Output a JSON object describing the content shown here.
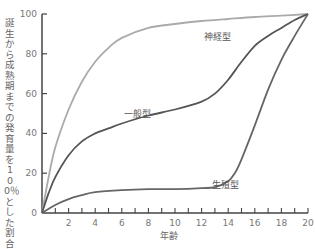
{
  "chart_data": {
    "type": "line",
    "title": "",
    "xlabel": "年齢",
    "ylabel": "誕生から成熟期までの発育量を100％とした割合",
    "xlim": [
      0,
      20
    ],
    "ylim": [
      0,
      100
    ],
    "xticks": [
      2,
      4,
      6,
      8,
      10,
      12,
      14,
      16,
      18,
      20
    ],
    "yticks": [
      0,
      20,
      40,
      60,
      80,
      100
    ],
    "grid": false,
    "legend": "inline labels",
    "series": [
      {
        "name": "神経型",
        "color": "#aaaaaa",
        "label_pos": [
          12.2,
          87
        ],
        "x": [
          0,
          0.5,
          1,
          2,
          3,
          4,
          5,
          6,
          8,
          10,
          12,
          14,
          16,
          18,
          20
        ],
        "y": [
          0,
          18,
          33,
          52,
          66,
          76,
          83,
          88,
          93,
          95,
          96.5,
          97.5,
          98.5,
          99.2,
          100
        ]
      },
      {
        "name": "一般型",
        "color": "#555555",
        "label_pos": [
          6.2,
          48
        ],
        "x": [
          0,
          0.5,
          1,
          2,
          3,
          4,
          5,
          6,
          8,
          10,
          12,
          13,
          14,
          15,
          16,
          17,
          18,
          19,
          20
        ],
        "y": [
          0,
          10,
          18,
          29,
          36,
          40,
          42.5,
          45,
          49,
          52,
          56,
          60,
          67,
          76,
          84,
          89,
          93,
          97,
          100
        ]
      },
      {
        "name": "生殖型",
        "color": "#666666",
        "label_pos": [
          12.8,
          12.5
        ],
        "x": [
          0,
          1,
          2,
          3,
          4,
          6,
          8,
          10,
          12,
          13,
          14,
          14.5,
          15,
          16,
          17,
          18,
          19,
          20
        ],
        "y": [
          0,
          4,
          7,
          9,
          10.5,
          11.5,
          12,
          12,
          12.5,
          13,
          16,
          20,
          27,
          44,
          62,
          77,
          89,
          100
        ]
      }
    ]
  }
}
